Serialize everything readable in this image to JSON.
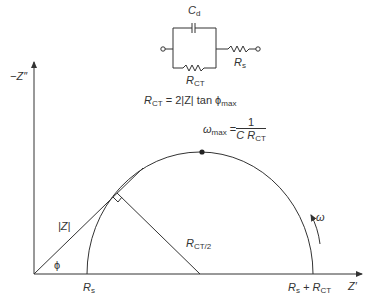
{
  "circuit": {
    "capacitor_label": "C",
    "capacitor_sub": "d",
    "resistor_ct_label": "R",
    "resistor_ct_sub": "CT",
    "resistor_s_label": "R",
    "resistor_s_sub": "s"
  },
  "equation": {
    "lhs": "R",
    "lhs_sub": "CT",
    "rhs": " = 2|Z| tan ϕ",
    "rhs_sub": "max"
  },
  "axes": {
    "y_label": "−Z″",
    "x_label": "Z′"
  },
  "annotations": {
    "omega_max_prefix": "ω",
    "omega_max_sub": "max",
    "omega_max_eq": "=",
    "frac_num": "1",
    "frac_den": "C R",
    "frac_den_sub": "CT",
    "modulus_z": "|Z|",
    "phi": "ϕ",
    "radius_label": "R",
    "radius_sub": "CT/2",
    "omega_arrow": "ω",
    "rs_tick": "R",
    "rs_tick_sub": "s",
    "rs_rct_tick_a": "R",
    "rs_rct_tick_a_sub": "s",
    "rs_rct_tick_plus": " + R",
    "rs_rct_tick_b_sub": "CT"
  },
  "colors": {
    "line": "#333333",
    "background": "#ffffff"
  }
}
